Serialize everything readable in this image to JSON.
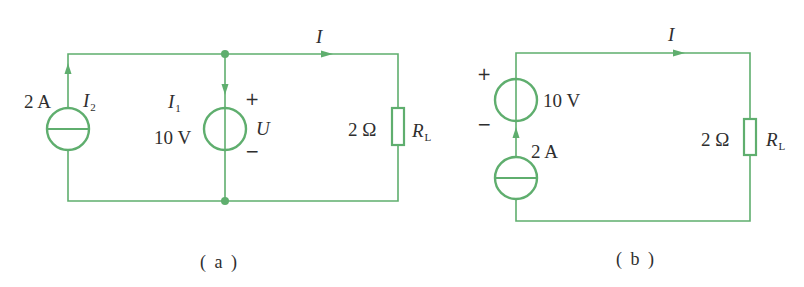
{
  "colors": {
    "wire": "#5fae6e",
    "text": "#2e2e2e",
    "background": "#ffffff"
  },
  "circuit_a": {
    "caption": "( a )",
    "current_label": "I",
    "current_source": {
      "value": "2 A",
      "current_name": "I",
      "current_sub": "2"
    },
    "voltage_source": {
      "value": "10 V",
      "current_name": "I",
      "current_sub": "1",
      "plus": "+",
      "minus": "−",
      "voltage_name": "U"
    },
    "resistor": {
      "value": "2 Ω",
      "name": "R",
      "name_sub": "L"
    }
  },
  "circuit_b": {
    "caption": "( b )",
    "current_label": "I",
    "voltage_source": {
      "value": "10 V",
      "plus": "+",
      "minus": "−"
    },
    "current_source": {
      "value": "2 A"
    },
    "resistor": {
      "value": "2 Ω",
      "name": "R",
      "name_sub": "L"
    }
  }
}
